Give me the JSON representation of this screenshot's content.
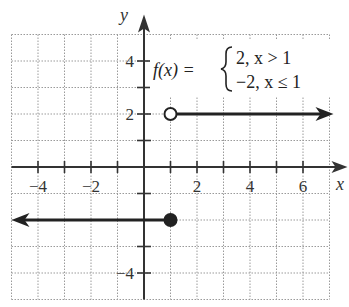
{
  "chart_data": {
    "type": "line",
    "title": "",
    "xlabel": "x",
    "ylabel": "y",
    "xlim": [
      -5,
      7
    ],
    "ylim": [
      -5,
      5
    ],
    "grid": true,
    "x_ticks": [
      -4,
      -3,
      -2,
      -1,
      1,
      2,
      3,
      4,
      5,
      6
    ],
    "y_ticks": [
      -4,
      -3,
      -2,
      -1,
      1,
      2,
      3,
      4
    ],
    "x_tick_labels": [
      {
        "value": -4,
        "label": "−4"
      },
      {
        "value": -2,
        "label": "−2"
      },
      {
        "value": 2,
        "label": "2"
      },
      {
        "value": 4,
        "label": "4"
      },
      {
        "value": 6,
        "label": "6"
      }
    ],
    "y_tick_labels": [
      {
        "value": 4,
        "label": "4"
      },
      {
        "value": 2,
        "label": "2"
      },
      {
        "value": -4,
        "label": "−4"
      }
    ],
    "function": {
      "name": "f(x)",
      "lhs": "f(x) =",
      "cases": [
        {
          "value": "2",
          "condition": "x > 1",
          "text": "2, x > 1"
        },
        {
          "value": "−2",
          "condition": "x ≤ 1",
          "text": "−2, x ≤ 1"
        }
      ]
    },
    "series": [
      {
        "name": "f(x) = 2 for x > 1",
        "x": [
          1,
          7
        ],
        "y": [
          2,
          2
        ],
        "start_point": {
          "x": 1,
          "y": 2,
          "style": "open"
        },
        "arrow": "right"
      },
      {
        "name": "f(x) = -2 for x <= 1",
        "x": [
          -5,
          1
        ],
        "y": [
          -2,
          -2
        ],
        "end_point": {
          "x": 1,
          "y": -2,
          "style": "closed"
        },
        "arrow": "left"
      }
    ],
    "colors": {
      "line": "#222222",
      "axis": "#333333",
      "grid": "#9a9a9a"
    }
  }
}
